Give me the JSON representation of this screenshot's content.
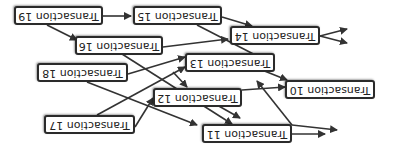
{
  "orientation": "rotated 180 degrees",
  "nodes": [
    {
      "id": "t10",
      "label": "Transaction 10"
    },
    {
      "id": "t11",
      "label": "Transaction 11"
    },
    {
      "id": "t12",
      "label": "Transaction 12"
    },
    {
      "id": "t13",
      "label": "Transaction 13"
    },
    {
      "id": "t14",
      "label": "Transaction 14"
    },
    {
      "id": "t15",
      "label": "Transaction 15"
    },
    {
      "id": "t16",
      "label": "Transaction 16"
    },
    {
      "id": "t17",
      "label": "Transaction 17"
    },
    {
      "id": "t18",
      "label": "Transaction 18"
    },
    {
      "id": "t19",
      "label": "Transaction 19"
    }
  ],
  "edges": [
    [
      "t10",
      "out"
    ],
    [
      "t10",
      "out"
    ],
    [
      "t11",
      "out"
    ],
    [
      "t14",
      "out"
    ],
    [
      "t14",
      "out"
    ],
    [
      "t19",
      "t15"
    ],
    [
      "t19",
      "t16"
    ],
    [
      "t15",
      "t14"
    ],
    [
      "t15",
      "t13"
    ],
    [
      "t16",
      "t14"
    ],
    [
      "t16",
      "t11"
    ],
    [
      "t18",
      "t13"
    ],
    [
      "t18",
      "t10"
    ],
    [
      "t13",
      "t12"
    ],
    [
      "t13",
      "t10"
    ],
    [
      "t12",
      "t10"
    ],
    [
      "t12",
      "t11"
    ],
    [
      "t17",
      "t13"
    ],
    [
      "t17",
      "t12"
    ],
    [
      "t11",
      "t10"
    ]
  ],
  "colors": {
    "border": "#2b2b2b",
    "arrow": "#333333",
    "background": "#ffffff"
  }
}
